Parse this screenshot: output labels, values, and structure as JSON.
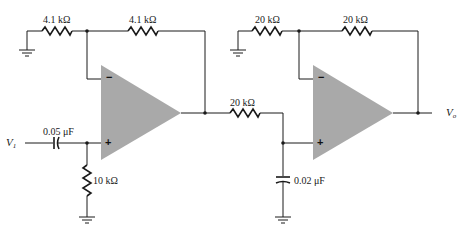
{
  "diagram": {
    "type": "circuit-schematic",
    "colors": {
      "wire": "#1a1a1a",
      "opamp_fill": "#a9a9a9",
      "background": "#ffffff"
    },
    "input": {
      "label": "V",
      "subscript": "1"
    },
    "output": {
      "label": "V",
      "subscript": "o"
    },
    "stage1": {
      "opamp": {
        "minus": "−",
        "plus": "+"
      },
      "r_ground": "4.1 kΩ",
      "r_feedback": "4.1 kΩ",
      "c_input": "0.05 μF",
      "r_input_shunt": "10 kΩ"
    },
    "coupling": {
      "r_series": "20 kΩ",
      "c_shunt": "0.02 μF"
    },
    "stage2": {
      "opamp": {
        "minus": "−",
        "plus": "+"
      },
      "r_ground": "20 kΩ",
      "r_feedback": "20 kΩ"
    }
  }
}
